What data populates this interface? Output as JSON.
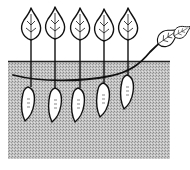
{
  "illustration": {
    "subject": "sweet potato plant cross-section",
    "description": "Vine running along and under the soil surface with upright leaves above ground and tubers hanging below",
    "colors": {
      "ink": "#111111",
      "soil": "#bdbdbd",
      "soil_dots": "#8a8a8a",
      "leaf_fill": "#ffffff",
      "tuber_fill": "#ffffff",
      "background": "#ffffff"
    },
    "counts": {
      "upright_leaves": 5,
      "vine_tip_leaves": 2,
      "tubers": 5
    },
    "icons": [
      "leaf-icon",
      "tuber-icon",
      "vine",
      "soil"
    ]
  }
}
